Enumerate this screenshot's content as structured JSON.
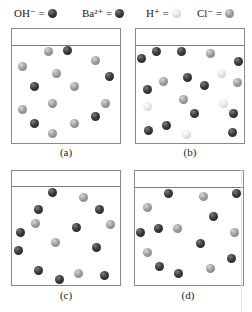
{
  "legend": [
    {
      "label": "OH⁻ =",
      "type": "dark",
      "icon": "oh-ion-ball-icon",
      "x": 14
    },
    {
      "label": "Ba²⁺ =",
      "type": "dark",
      "icon": "ba-ion-ball-icon",
      "x": 82
    },
    {
      "label": "H⁺ =",
      "type": "white",
      "icon": "h-ion-ball-icon",
      "x": 146
    },
    {
      "label": "Cl⁻ =",
      "type": "gray",
      "icon": "cl-ion-ball-icon",
      "x": 197
    }
  ],
  "panels": [
    {
      "id": "a",
      "caption": "(a)",
      "box": [
        11,
        28,
        110,
        116
      ],
      "line_y": 44,
      "caption_pos": [
        46,
        146
      ],
      "balls": [
        [
          48,
          51,
          "gray"
        ],
        [
          67,
          50,
          "dark"
        ],
        [
          95,
          60,
          "gray"
        ],
        [
          22,
          66,
          "gray"
        ],
        [
          56,
          73,
          "gray"
        ],
        [
          109,
          76,
          "dark"
        ],
        [
          34,
          86,
          "dark"
        ],
        [
          74,
          86,
          "gray"
        ],
        [
          52,
          103,
          "gray"
        ],
        [
          22,
          109,
          "gray"
        ],
        [
          105,
          103,
          "gray"
        ],
        [
          95,
          116,
          "dark"
        ],
        [
          34,
          123,
          "dark"
        ],
        [
          74,
          123,
          "gray"
        ],
        [
          52,
          133,
          "gray"
        ]
      ]
    },
    {
      "id": "b",
      "caption": "(b)",
      "box": [
        135,
        28,
        110,
        116
      ],
      "line_y": 44,
      "caption_pos": [
        170,
        146
      ],
      "balls": [
        [
          141,
          58,
          "dark"
        ],
        [
          156,
          51,
          "dark"
        ],
        [
          181,
          51,
          "dark"
        ],
        [
          210,
          53,
          "gray"
        ],
        [
          238,
          61,
          "dark"
        ],
        [
          221,
          73,
          "white"
        ],
        [
          163,
          81,
          "gray"
        ],
        [
          187,
          77,
          "dark"
        ],
        [
          204,
          85,
          "dark"
        ],
        [
          237,
          82,
          "gray"
        ],
        [
          147,
          89,
          "dark"
        ],
        [
          183,
          99,
          "gray"
        ],
        [
          147,
          106,
          "white"
        ],
        [
          223,
          103,
          "white"
        ],
        [
          194,
          113,
          "dark"
        ],
        [
          233,
          113,
          "dark"
        ],
        [
          166,
          125,
          "dark"
        ],
        [
          148,
          130,
          "dark"
        ],
        [
          186,
          134,
          "white"
        ],
        [
          232,
          132,
          "dark"
        ]
      ]
    },
    {
      "id": "c",
      "caption": "(c)",
      "box": [
        11,
        170,
        110,
        116
      ],
      "line_y": 185,
      "caption_pos": [
        46,
        289
      ],
      "balls": [
        [
          52,
          192,
          "dark"
        ],
        [
          83,
          197,
          "gray"
        ],
        [
          38,
          209,
          "dark"
        ],
        [
          99,
          209,
          "dark"
        ],
        [
          35,
          223,
          "gray"
        ],
        [
          76,
          227,
          "dark"
        ],
        [
          110,
          224,
          "gray"
        ],
        [
          20,
          232,
          "dark"
        ],
        [
          55,
          242,
          "gray"
        ],
        [
          18,
          250,
          "dark"
        ],
        [
          96,
          247,
          "dark"
        ],
        [
          38,
          270,
          "dark"
        ],
        [
          78,
          273,
          "gray"
        ],
        [
          59,
          279,
          "dark"
        ],
        [
          104,
          275,
          "dark"
        ]
      ]
    },
    {
      "id": "d",
      "caption": "(d)",
      "box": [
        134,
        170,
        110,
        116
      ],
      "line_y": 186,
      "caption_pos": [
        168,
        289
      ],
      "balls": [
        [
          168,
          193,
          "dark"
        ],
        [
          203,
          196,
          "gray"
        ],
        [
          236,
          193,
          "dark"
        ],
        [
          147,
          207,
          "gray"
        ],
        [
          213,
          216,
          "dark"
        ],
        [
          158,
          228,
          "dark"
        ],
        [
          177,
          228,
          "gray"
        ],
        [
          140,
          232,
          "dark"
        ],
        [
          234,
          232,
          "gray"
        ],
        [
          200,
          243,
          "dark"
        ],
        [
          147,
          252,
          "gray"
        ],
        [
          231,
          258,
          "dark"
        ],
        [
          159,
          266,
          "dark"
        ],
        [
          178,
          273,
          "dark"
        ],
        [
          210,
          268,
          "gray"
        ]
      ]
    }
  ],
  "colors": {
    "dark": "#2a2a2a",
    "gray": "#9a9a9a",
    "white": "#e6e6e6",
    "border": "#8a8a8a"
  }
}
